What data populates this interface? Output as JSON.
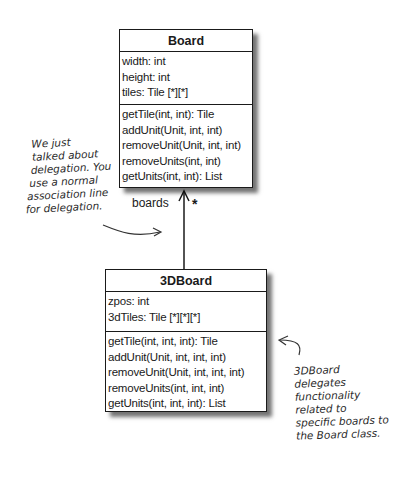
{
  "classes": {
    "board": {
      "name": "Board",
      "attributes": [
        "width: int",
        "height: int",
        "tiles: Tile [*][*]"
      ],
      "methods": [
        "getTile(int, int): Tile",
        "addUnit(Unit, int, int)",
        "removeUnit(Unit, int, int)",
        "removeUnits(int, int)",
        "getUnits(int, int): List"
      ]
    },
    "board3d": {
      "name": "3DBoard",
      "attributes": [
        "zpos: int",
        "3dTiles: Tile [*][*][*]"
      ],
      "methods": [
        "getTile(int, int, int): Tile",
        "addUnit(Unit, int, int, int)",
        "removeUnit(Unit, int, int, int)",
        "removeUnits(int, int, int)",
        "getUnits(int, int, int): List"
      ]
    }
  },
  "association": {
    "role": "boards",
    "multiplicity": "*"
  },
  "notes": {
    "left": [
      "We just",
      "talked about",
      "delegation. You",
      "use a normal",
      "association line",
      "for delegation."
    ],
    "right": [
      "3DBoard",
      "delegates",
      "functionality",
      "related to",
      "specific boards to",
      "the Board class."
    ]
  }
}
